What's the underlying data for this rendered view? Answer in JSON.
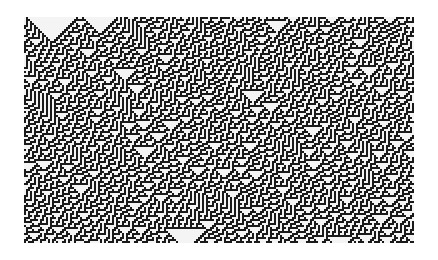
{
  "image": {
    "description": "Elementary cellular automaton evolution pattern (black and white)",
    "colors": {
      "background": "#ffffff",
      "on": "#1a1a1a",
      "off": "#f4f4f4"
    },
    "grid": {
      "left": 24,
      "top": 17,
      "width": 390,
      "height": 226,
      "cell_px": 2
    },
    "rule": 30,
    "initial_segments": [
      {
        "from": 0,
        "to": 3,
        "fill": "random"
      },
      {
        "from": 3,
        "to": 23,
        "fill": "zero"
      },
      {
        "from": 23,
        "to": 29,
        "fill": "random"
      },
      {
        "from": 29,
        "to": 30,
        "fill": "one"
      },
      {
        "from": 30,
        "to": 44,
        "fill": "zero"
      },
      {
        "from": 44,
        "to": 195,
        "fill": "random"
      }
    ]
  }
}
